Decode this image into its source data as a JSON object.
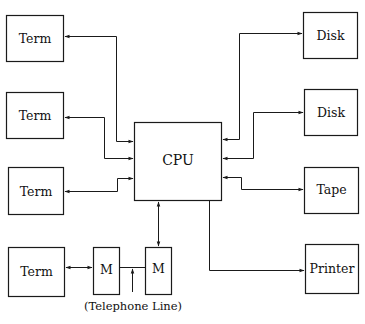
{
  "diagram": {
    "type": "block-diagram",
    "nodes": [
      {
        "id": "term1",
        "label": "Term",
        "x": 6,
        "y": 15,
        "w": 57,
        "h": 46
      },
      {
        "id": "term2",
        "label": "Term",
        "x": 6,
        "y": 92,
        "w": 57,
        "h": 46
      },
      {
        "id": "term3",
        "label": "Term",
        "x": 8,
        "y": 167,
        "w": 55,
        "h": 47
      },
      {
        "id": "term4",
        "label": "Term",
        "x": 8,
        "y": 247,
        "w": 56,
        "h": 49
      },
      {
        "id": "modem1",
        "label": "M",
        "x": 93,
        "y": 247,
        "w": 26,
        "h": 47
      },
      {
        "id": "modem2",
        "label": "M",
        "x": 145,
        "y": 247,
        "w": 26,
        "h": 47
      },
      {
        "id": "cpu",
        "label": "CPU",
        "x": 134,
        "y": 122,
        "w": 87,
        "h": 78
      },
      {
        "id": "disk1",
        "label": "Disk",
        "x": 303,
        "y": 12,
        "w": 54,
        "h": 46
      },
      {
        "id": "disk2",
        "label": "Disk",
        "x": 304,
        "y": 89,
        "w": 53,
        "h": 46
      },
      {
        "id": "tape",
        "label": "Tape",
        "x": 304,
        "y": 167,
        "w": 54,
        "h": 46
      },
      {
        "id": "printer",
        "label": "Printer",
        "x": 305,
        "y": 244,
        "w": 53,
        "h": 49
      }
    ],
    "edges": [
      {
        "from": "cpu",
        "to": "term1",
        "direction": "bidirectional"
      },
      {
        "from": "cpu",
        "to": "term2",
        "direction": "bidirectional"
      },
      {
        "from": "cpu",
        "to": "term3",
        "direction": "bidirectional"
      },
      {
        "from": "term4",
        "to": "modem1",
        "direction": "bidirectional"
      },
      {
        "from": "modem1",
        "to": "modem2",
        "direction": "none",
        "label": "(Telephone Line)"
      },
      {
        "from": "cpu",
        "to": "modem2",
        "direction": "bidirectional"
      },
      {
        "from": "cpu",
        "to": "disk1",
        "direction": "bidirectional"
      },
      {
        "from": "cpu",
        "to": "disk2",
        "direction": "bidirectional"
      },
      {
        "from": "cpu",
        "to": "tape",
        "direction": "bidirectional"
      },
      {
        "from": "cpu",
        "to": "printer",
        "direction": "unidirectional"
      }
    ],
    "annotation": "(Telephone Line)"
  },
  "labels": {
    "term1": "Term",
    "term2": "Term",
    "term3": "Term",
    "term4": "Term",
    "modem1": "M",
    "modem2": "M",
    "cpu": "CPU",
    "disk1": "Disk",
    "disk2": "Disk",
    "tape": "Tape",
    "printer": "Printer",
    "telephone_line": "(Telephone Line)"
  },
  "colors": {
    "line": "#1a1a1a",
    "background": "#ffffff"
  }
}
